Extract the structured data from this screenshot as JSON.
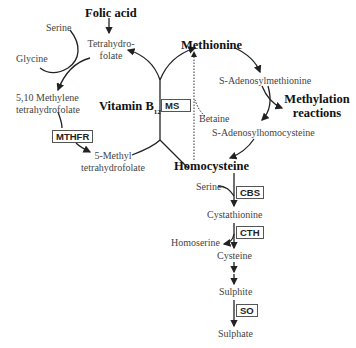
{
  "diagram": {
    "nodes": {
      "folic_acid": "Folic acid",
      "tetrahydrofolate_1": "Tetrahydro-",
      "tetrahydrofolate_2": "folate",
      "serine_top": "Serine",
      "glycine": "Glycine",
      "methylene_thf_1": "5,10 Methylene",
      "methylene_thf_2": "tetrahydrofolate",
      "methyl_thf_1": "5-Methyl",
      "methyl_thf_2": "tetrahydrofolate",
      "vitamin_b12": "Vitamin B",
      "vitamin_b12_sub": "12",
      "methionine": "Methionine",
      "sam": "S-Adenosylmethionine",
      "methylation_1": "Methylation",
      "methylation_2": "reactions",
      "sah": "S-Adenosylhomocysteine",
      "betaine": "Betaine",
      "homocysteine": "Homocysteine",
      "serine_cbs": "Serine",
      "cystathionine": "Cystathionine",
      "homoserine": "Homoserine",
      "cysteine": "Cysteine",
      "sulphite": "Sulphite",
      "sulphate": "Sulphate"
    },
    "enzymes": {
      "mthfr": "MTHFR",
      "ms": "MS",
      "cbs": "CBS",
      "cth": "CTH",
      "so": "SO"
    }
  }
}
